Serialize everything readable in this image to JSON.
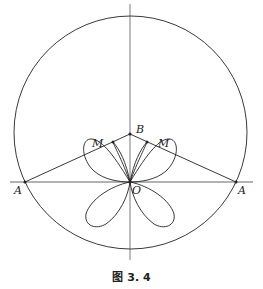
{
  "figure": {
    "caption": "图 3. 4",
    "labels": {
      "A_left": "A",
      "A_right": "A",
      "B": "B",
      "O": "O",
      "M_left": "M",
      "M_right": "M"
    },
    "colors": {
      "stroke": "#222222",
      "background": "#ffffff"
    }
  }
}
